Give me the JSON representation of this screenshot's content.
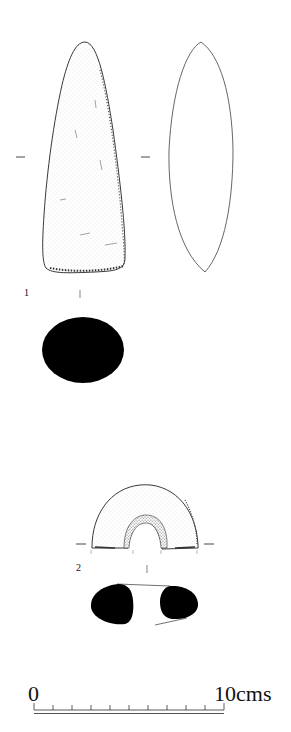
{
  "figures": [
    {
      "number": "1",
      "object": "stone axe",
      "views": [
        "face view (stippled)",
        "side profile (outline)",
        "cross-section (solid black)"
      ]
    },
    {
      "number": "2",
      "object": "perforated stone / mace-head fragment",
      "views": [
        "face view (stippled, semicircular with central perforation)",
        "cross-section (two solid black lobes)"
      ]
    }
  ],
  "scale_bar": {
    "start_label": "0",
    "end_label": "10cms",
    "divisions": 10
  },
  "colors": {
    "ink": "#111111",
    "paper": "#ffffff",
    "stipple": "#8a8a8a"
  }
}
